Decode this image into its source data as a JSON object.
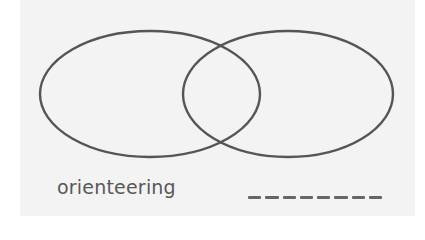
{
  "diagram": {
    "type": "venn",
    "sets": [
      {
        "name": "left-set",
        "label": ""
      },
      {
        "name": "right-set",
        "label": ""
      }
    ],
    "colors": {
      "stroke": "#555555",
      "background": "#f3f3f3",
      "text": "#585858"
    }
  },
  "labels": {
    "left_word": "orienteering",
    "right_blank_dashes": 8
  }
}
